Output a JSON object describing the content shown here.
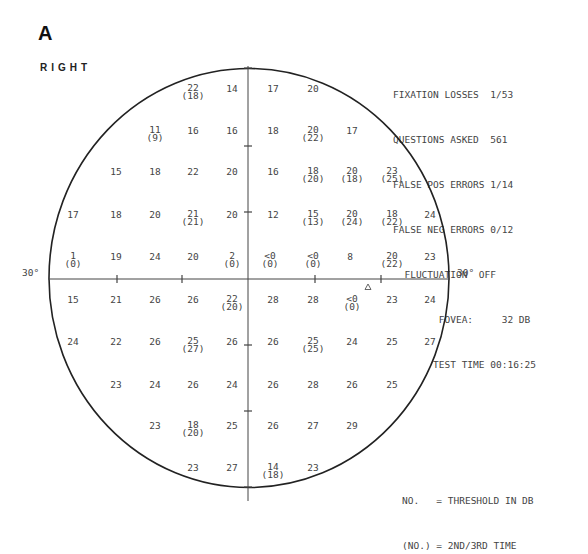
{
  "panel_label": "A",
  "eye": "RIGHT",
  "stats": {
    "fixation_losses_label": "FIXATION LOSSES",
    "fixation_losses": "1/53",
    "questions_asked_label": "QUESTIONS ASKED",
    "questions_asked": "561",
    "false_pos_label": "FALSE POS ERRORS",
    "false_pos": "1/14",
    "false_neg_label": "FALSE NEG ERRORS",
    "false_neg": "0/12",
    "fluctuation_label": "FLUCTUATION",
    "fluctuation": "OFF",
    "fovea_label": "FOVEA:",
    "fovea": "32 DB",
    "test_time_label": "TEST TIME",
    "test_time": "00:16:25"
  },
  "axis_labels": {
    "left": "30°",
    "right": "30°"
  },
  "legend": {
    "line1": "NO.   = THRESHOLD IN DB",
    "line2": "(NO.) = 2ND/3RD TIME"
  },
  "chart_data": {
    "type": "table",
    "xlabel": "",
    "ylabel": "",
    "extent_degrees": 30,
    "units": "dB",
    "note": "Each point: first threshold value; repeat value in parentheses where retested",
    "points": [
      {
        "x": 193,
        "y": 89,
        "value": "22",
        "repeat": "(18)"
      },
      {
        "x": 232,
        "y": 89,
        "value": "14"
      },
      {
        "x": 273,
        "y": 89,
        "value": "17"
      },
      {
        "x": 313,
        "y": 89,
        "value": "20"
      },
      {
        "x": 155,
        "y": 131,
        "value": "11",
        "repeat": "(9)"
      },
      {
        "x": 193,
        "y": 131,
        "value": "16"
      },
      {
        "x": 232,
        "y": 131,
        "value": "16"
      },
      {
        "x": 273,
        "y": 131,
        "value": "18"
      },
      {
        "x": 313,
        "y": 131,
        "value": "20",
        "repeat": "(22)"
      },
      {
        "x": 352,
        "y": 131,
        "value": "17"
      },
      {
        "x": 116,
        "y": 172,
        "value": "15"
      },
      {
        "x": 155,
        "y": 172,
        "value": "18"
      },
      {
        "x": 193,
        "y": 172,
        "value": "22"
      },
      {
        "x": 232,
        "y": 172,
        "value": "20"
      },
      {
        "x": 273,
        "y": 172,
        "value": "16"
      },
      {
        "x": 313,
        "y": 172,
        "value": "18",
        "repeat": "(20)"
      },
      {
        "x": 352,
        "y": 172,
        "value": "20",
        "repeat": "(18)"
      },
      {
        "x": 392,
        "y": 172,
        "value": "23",
        "repeat": "(25)"
      },
      {
        "x": 73,
        "y": 215,
        "value": "17"
      },
      {
        "x": 116,
        "y": 215,
        "value": "18"
      },
      {
        "x": 155,
        "y": 215,
        "value": "20"
      },
      {
        "x": 193,
        "y": 215,
        "value": "21",
        "repeat": "(21)"
      },
      {
        "x": 232,
        "y": 215,
        "value": "20"
      },
      {
        "x": 273,
        "y": 215,
        "value": "12"
      },
      {
        "x": 313,
        "y": 215,
        "value": "15",
        "repeat": "(13)"
      },
      {
        "x": 352,
        "y": 215,
        "value": "20",
        "repeat": "(24)"
      },
      {
        "x": 392,
        "y": 215,
        "value": "18",
        "repeat": "(22)"
      },
      {
        "x": 430,
        "y": 215,
        "value": "24"
      },
      {
        "x": 73,
        "y": 257,
        "value": "1",
        "repeat": "(0)"
      },
      {
        "x": 116,
        "y": 257,
        "value": "19"
      },
      {
        "x": 155,
        "y": 257,
        "value": "24"
      },
      {
        "x": 193,
        "y": 257,
        "value": "20"
      },
      {
        "x": 232,
        "y": 257,
        "value": "2",
        "repeat": "(0)"
      },
      {
        "x": 270,
        "y": 257,
        "value": "<0",
        "repeat": "(0)"
      },
      {
        "x": 313,
        "y": 257,
        "value": "<0",
        "repeat": "(0)"
      },
      {
        "x": 350,
        "y": 257,
        "value": "8"
      },
      {
        "x": 392,
        "y": 257,
        "value": "20",
        "repeat": "(22)"
      },
      {
        "x": 430,
        "y": 257,
        "value": "23"
      },
      {
        "x": 73,
        "y": 300,
        "value": "15"
      },
      {
        "x": 116,
        "y": 300,
        "value": "21"
      },
      {
        "x": 155,
        "y": 300,
        "value": "26"
      },
      {
        "x": 193,
        "y": 300,
        "value": "26"
      },
      {
        "x": 232,
        "y": 300,
        "value": "22",
        "repeat": "(20)"
      },
      {
        "x": 273,
        "y": 300,
        "value": "28"
      },
      {
        "x": 313,
        "y": 300,
        "value": "28"
      },
      {
        "x": 352,
        "y": 300,
        "value": "<0",
        "repeat": "(0)"
      },
      {
        "x": 392,
        "y": 300,
        "value": "23"
      },
      {
        "x": 430,
        "y": 300,
        "value": "24"
      },
      {
        "x": 73,
        "y": 342,
        "value": "24"
      },
      {
        "x": 116,
        "y": 342,
        "value": "22"
      },
      {
        "x": 155,
        "y": 342,
        "value": "26"
      },
      {
        "x": 193,
        "y": 342,
        "value": "25",
        "repeat": "(27)"
      },
      {
        "x": 232,
        "y": 342,
        "value": "26"
      },
      {
        "x": 273,
        "y": 342,
        "value": "26"
      },
      {
        "x": 313,
        "y": 342,
        "value": "25",
        "repeat": "(25)"
      },
      {
        "x": 352,
        "y": 342,
        "value": "24"
      },
      {
        "x": 392,
        "y": 342,
        "value": "25"
      },
      {
        "x": 430,
        "y": 342,
        "value": "27"
      },
      {
        "x": 116,
        "y": 385,
        "value": "23"
      },
      {
        "x": 155,
        "y": 385,
        "value": "24"
      },
      {
        "x": 193,
        "y": 385,
        "value": "26"
      },
      {
        "x": 232,
        "y": 385,
        "value": "24"
      },
      {
        "x": 273,
        "y": 385,
        "value": "26"
      },
      {
        "x": 313,
        "y": 385,
        "value": "28"
      },
      {
        "x": 352,
        "y": 385,
        "value": "26"
      },
      {
        "x": 392,
        "y": 385,
        "value": "25"
      },
      {
        "x": 155,
        "y": 426,
        "value": "23"
      },
      {
        "x": 193,
        "y": 426,
        "value": "18",
        "repeat": "(20)"
      },
      {
        "x": 232,
        "y": 426,
        "value": "25"
      },
      {
        "x": 273,
        "y": 426,
        "value": "26"
      },
      {
        "x": 313,
        "y": 426,
        "value": "27"
      },
      {
        "x": 352,
        "y": 426,
        "value": "29"
      },
      {
        "x": 193,
        "y": 468,
        "value": "23"
      },
      {
        "x": 232,
        "y": 468,
        "value": "27"
      },
      {
        "x": 273,
        "y": 468,
        "value": "14",
        "repeat": "(18)"
      },
      {
        "x": 313,
        "y": 468,
        "value": "23"
      }
    ],
    "blind_spot_marker": {
      "x": 368,
      "y": 287,
      "symbol": "triangle"
    }
  }
}
